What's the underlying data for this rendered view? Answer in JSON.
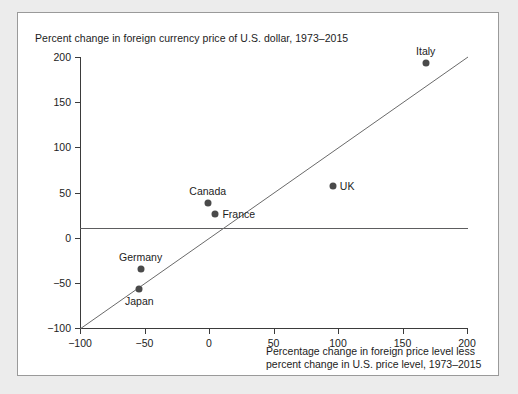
{
  "chart_data": {
    "type": "scatter",
    "title": "Percent change in foreign currency price of U.S. dollar, 1973–2015",
    "xlabel_line1": "Percentage change in foreign price level less",
    "xlabel_line2": "percent change in U.S. price level, 1973–2015",
    "ylabel": "",
    "xlim": [
      -100,
      200
    ],
    "ylim": [
      -100,
      200
    ],
    "xticks": [
      -100,
      -50,
      0,
      50,
      100,
      150,
      200
    ],
    "xtick_labels": [
      "−100",
      "−50",
      "0",
      "50",
      "100",
      "150",
      "200"
    ],
    "yticks": [
      -100,
      -50,
      0,
      50,
      100,
      150,
      200
    ],
    "ytick_labels": [
      "−100",
      "−50",
      "0",
      "50",
      "100",
      "150",
      "200"
    ],
    "grid": false,
    "legend": "none",
    "zero_line": true,
    "reference_line": {
      "name": "45-degree line",
      "from": [
        -100,
        -100
      ],
      "to": [
        200,
        200
      ]
    },
    "points": [
      {
        "label": "Italy",
        "x": 168,
        "y": 193,
        "label_pos": "above"
      },
      {
        "label": "UK",
        "x": 96,
        "y": 57,
        "label_pos": "right"
      },
      {
        "label": "Canada",
        "x": -1,
        "y": 38,
        "label_pos": "above"
      },
      {
        "label": "France",
        "x": 5,
        "y": 26,
        "label_pos": "right"
      },
      {
        "label": "Germany",
        "x": -53,
        "y": -35,
        "label_pos": "above"
      },
      {
        "label": "Japan",
        "x": -54,
        "y": -57,
        "label_pos": "below"
      }
    ],
    "colors": {
      "marker": "#4a4a4a",
      "axis": "#3b3b3b",
      "zero_line": "#5d5d5f",
      "reference_line": "#6a6a6a",
      "text": "#1c1c1c",
      "card_background": "#ffffff",
      "page_background": "#ececec",
      "card_border": "#9a9a9a"
    }
  }
}
